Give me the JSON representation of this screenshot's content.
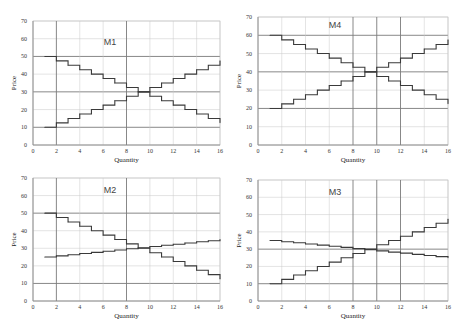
{
  "chart_data": [
    {
      "type": "line",
      "title": "M1",
      "xlabel": "Quantity",
      "ylabel": "Price",
      "xlim": [
        0,
        16
      ],
      "ylim": [
        0,
        70
      ],
      "xticks": [
        0,
        2,
        4,
        6,
        8,
        10,
        12,
        14,
        16
      ],
      "yticks": [
        0,
        10,
        20,
        30,
        40,
        50,
        60,
        70
      ],
      "grid": true,
      "emphasized_x": [
        2,
        8
      ],
      "emphasized_y": [
        10,
        30,
        50
      ],
      "series": [
        {
          "name": "demand",
          "step": true,
          "x": [
            1,
            2,
            3,
            4,
            5,
            6,
            7,
            8,
            9,
            10,
            11,
            12,
            13,
            14,
            15,
            16
          ],
          "values": [
            50,
            47.5,
            45,
            42.5,
            40,
            37.5,
            35,
            32.5,
            30,
            27.5,
            25,
            22.5,
            20,
            17.5,
            15,
            12.5
          ]
        },
        {
          "name": "supply",
          "step": true,
          "x": [
            1,
            2,
            3,
            4,
            5,
            6,
            7,
            8,
            9,
            10,
            11,
            12,
            13,
            14,
            15,
            16
          ],
          "values": [
            10,
            12.5,
            15,
            17.5,
            20,
            22.5,
            25,
            27.5,
            30,
            32.5,
            35,
            37.5,
            40,
            42.5,
            45,
            47.5
          ]
        }
      ]
    },
    {
      "type": "line",
      "title": "M4",
      "xlabel": "Quantity",
      "ylabel": "Price",
      "xlim": [
        0,
        16
      ],
      "ylim": [
        0,
        70
      ],
      "xticks": [
        0,
        2,
        4,
        6,
        8,
        10,
        12,
        14,
        16
      ],
      "yticks": [
        0,
        10,
        20,
        30,
        40,
        50,
        60,
        70
      ],
      "grid": true,
      "emphasized_x": [
        8,
        10,
        12
      ],
      "emphasized_y": [
        20,
        40,
        60
      ],
      "series": [
        {
          "name": "demand",
          "step": true,
          "x": [
            1,
            2,
            3,
            4,
            5,
            6,
            7,
            8,
            9,
            10,
            11,
            12,
            13,
            14,
            15,
            16
          ],
          "values": [
            60,
            57.5,
            55,
            52.5,
            50,
            47.5,
            45,
            42.5,
            40,
            37.5,
            35,
            32.5,
            30,
            27.5,
            25,
            22.5
          ]
        },
        {
          "name": "supply",
          "step": true,
          "x": [
            1,
            2,
            3,
            4,
            5,
            6,
            7,
            8,
            9,
            10,
            11,
            12,
            13,
            14,
            15,
            16
          ],
          "values": [
            20,
            22.5,
            25,
            27.5,
            30,
            32.5,
            35,
            37.5,
            40,
            42.5,
            45,
            47.5,
            50,
            52.5,
            55,
            57.5
          ]
        }
      ]
    },
    {
      "type": "line",
      "title": "M2",
      "xlabel": "Quantity",
      "ylabel": "Price",
      "xlim": [
        0,
        16
      ],
      "ylim": [
        0,
        70
      ],
      "xticks": [
        0,
        2,
        4,
        6,
        8,
        10,
        12,
        14,
        16
      ],
      "yticks": [
        0,
        10,
        20,
        30,
        40,
        50,
        60,
        70
      ],
      "grid": true,
      "emphasized_x": [
        2,
        8
      ],
      "emphasized_y": [
        10,
        50
      ],
      "series": [
        {
          "name": "demand",
          "step": true,
          "x": [
            1,
            2,
            3,
            4,
            5,
            6,
            7,
            8,
            9,
            10,
            11,
            12,
            13,
            14,
            15,
            16
          ],
          "values": [
            50,
            47.5,
            45,
            42.5,
            40,
            37.5,
            35,
            32.5,
            30,
            27.5,
            25,
            22.5,
            20,
            17.5,
            15,
            12.5
          ]
        },
        {
          "name": "supply",
          "step": true,
          "x": [
            1,
            2,
            3,
            4,
            5,
            6,
            7,
            8,
            9,
            10,
            11,
            12,
            13,
            14,
            15,
            16
          ],
          "values": [
            25,
            25.7,
            26.3,
            27,
            27.7,
            28.3,
            29,
            29.7,
            30.3,
            31,
            31.7,
            32.3,
            33,
            33.7,
            34.3,
            35
          ]
        }
      ]
    },
    {
      "type": "line",
      "title": "M3",
      "xlabel": "Quantity",
      "ylabel": "Price",
      "xlim": [
        0,
        16
      ],
      "ylim": [
        0,
        70
      ],
      "xticks": [
        0,
        2,
        4,
        6,
        8,
        10,
        12,
        14,
        16
      ],
      "yticks": [
        0,
        10,
        20,
        30,
        40,
        50,
        60,
        70
      ],
      "grid": true,
      "emphasized_x": [
        8,
        10,
        12
      ],
      "emphasized_y": [
        10,
        30
      ],
      "series": [
        {
          "name": "demand",
          "step": true,
          "x": [
            1,
            2,
            3,
            4,
            5,
            6,
            7,
            8,
            9,
            10,
            11,
            12,
            13,
            14,
            15,
            16
          ],
          "values": [
            35,
            34.3,
            33.7,
            33,
            32.3,
            31.7,
            31,
            30.3,
            29.7,
            29,
            28.3,
            27.7,
            27,
            26.3,
            25.7,
            25
          ]
        },
        {
          "name": "supply",
          "step": true,
          "x": [
            1,
            2,
            3,
            4,
            5,
            6,
            7,
            8,
            9,
            10,
            11,
            12,
            13,
            14,
            15,
            16
          ],
          "values": [
            10,
            12.5,
            15,
            17.5,
            20,
            22.5,
            25,
            27.5,
            30,
            32.5,
            35,
            37.5,
            40,
            42.5,
            45,
            47.5
          ]
        }
      ]
    }
  ]
}
